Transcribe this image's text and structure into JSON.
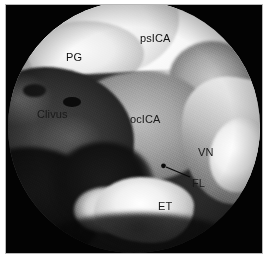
{
  "figure": {
    "kind": "endoscopic-surgical-photograph",
    "view": "endoscopic endonasal transclival view",
    "field_shape": "circle",
    "background_color": "#030303",
    "page_color": "#ffffff",
    "label_color": "#0a0a0a"
  },
  "labels": [
    {
      "id": "psICA",
      "text": "psICA",
      "meaning": "paraclival segment of the internal carotid artery",
      "x": 140,
      "y": 33
    },
    {
      "id": "PG",
      "text": "PG",
      "meaning": "pituitary gland",
      "x": 66,
      "y": 52
    },
    {
      "id": "Clivus",
      "text": "Clivus",
      "meaning": "clivus",
      "x": 37,
      "y": 109
    },
    {
      "id": "ocICA",
      "text": "ocICA",
      "meaning": "occipital / petrous segment of the internal carotid artery",
      "x": 130,
      "y": 114
    },
    {
      "id": "VN",
      "text": "VN",
      "meaning": "vidian nerve",
      "x": 198,
      "y": 147
    },
    {
      "id": "FL",
      "text": "FL",
      "meaning": "foramen lacerum",
      "x": 192,
      "y": 178
    },
    {
      "id": "ET",
      "text": "ET",
      "meaning": "eustachian tube",
      "x": 158,
      "y": 201
    }
  ],
  "leader_lines": [
    {
      "id": "fl-leader",
      "for_label": "FL",
      "from_x": 190,
      "from_y": 177,
      "to_x": 163,
      "to_y": 166,
      "marker": "dot",
      "color": "#0a0a0a"
    }
  ]
}
